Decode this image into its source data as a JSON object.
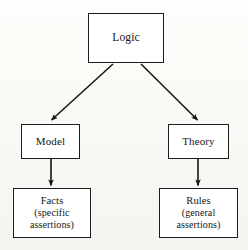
{
  "diagram": {
    "type": "tree",
    "background_color": "#fbfbf9",
    "stroke_color": "#1d1d1d",
    "text_color": "#151515",
    "nodes": [
      {
        "id": "logic",
        "lines": [
          "Logic"
        ],
        "level": 0
      },
      {
        "id": "model",
        "lines": [
          "Model"
        ],
        "level": 1
      },
      {
        "id": "theory",
        "lines": [
          "Theory"
        ],
        "level": 1
      },
      {
        "id": "facts",
        "lines": [
          "Facts",
          "(specific",
          "assertions)"
        ],
        "level": 2
      },
      {
        "id": "rules",
        "lines": [
          "Rules",
          "(general",
          "assertions)"
        ],
        "level": 2
      }
    ],
    "edges": [
      {
        "id": "logic-to-model",
        "from": "logic",
        "to": "model",
        "style": "diagonal-arrow"
      },
      {
        "id": "logic-to-theory",
        "from": "logic",
        "to": "theory",
        "style": "diagonal-arrow"
      },
      {
        "id": "model-to-facts",
        "from": "model",
        "to": "facts",
        "style": "vertical-arrow"
      },
      {
        "id": "theory-to-rules",
        "from": "theory",
        "to": "rules",
        "style": "vertical-arrow"
      }
    ]
  }
}
